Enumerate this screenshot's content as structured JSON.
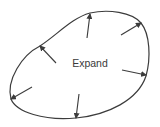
{
  "diagram": {
    "label": "Expand",
    "stroke_color": "#3c3c3c",
    "background": "#ffffff",
    "shape": "closed-blob-outline",
    "arrow_direction": "outward",
    "arrows": [
      {
        "id": "top",
        "from": [
          87,
          38
        ],
        "to": [
          90,
          14
        ]
      },
      {
        "id": "upper-right",
        "from": [
          121,
          35
        ],
        "to": [
          141,
          23
        ]
      },
      {
        "id": "right",
        "from": [
          122,
          70
        ],
        "to": [
          146,
          75
        ]
      },
      {
        "id": "bottom",
        "from": [
          79,
          94
        ],
        "to": [
          76,
          118
        ]
      },
      {
        "id": "lower-left",
        "from": [
          32,
          87
        ],
        "to": [
          11,
          99
        ]
      },
      {
        "id": "upper-left",
        "from": [
          56,
          63
        ],
        "to": [
          40,
          46
        ]
      }
    ]
  }
}
